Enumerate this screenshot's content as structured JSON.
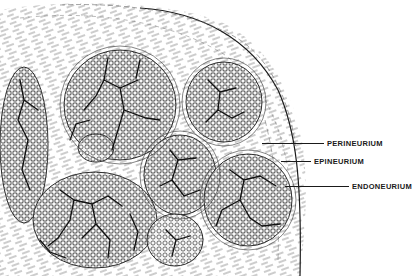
{
  "figure": {
    "style": "black ink line drawing on white",
    "colors": {
      "ink": "#1a1a1a",
      "background": "#ffffff",
      "fascicle_fill": "#f4f4f4"
    }
  },
  "labels": [
    {
      "id": "epineurium",
      "text": "EPINEURIUM",
      "x": 314,
      "y": 157,
      "line_from_x": 281,
      "line_to_x": 311
    },
    {
      "id": "perineurium",
      "text": "PERINEURIUM",
      "x": 327,
      "y": 140,
      "line_from_x": 262,
      "line_to_x": 324
    },
    {
      "id": "endoneurium",
      "text": "ENDONEURIUM",
      "x": 352,
      "y": 185,
      "line_from_x": 285,
      "line_to_x": 349
    }
  ],
  "fascicles": [
    {
      "cx": 120,
      "cy": 105,
      "rx": 56,
      "ry": 55
    },
    {
      "cx": 224,
      "cy": 102,
      "rx": 38,
      "ry": 40
    },
    {
      "cx": 24,
      "cy": 145,
      "rx": 24,
      "ry": 78
    },
    {
      "cx": 180,
      "cy": 175,
      "rx": 36,
      "ry": 40
    },
    {
      "cx": 248,
      "cy": 200,
      "rx": 44,
      "ry": 46
    },
    {
      "cx": 95,
      "cy": 220,
      "rx": 62,
      "ry": 48
    },
    {
      "cx": 175,
      "cy": 240,
      "rx": 28,
      "ry": 26
    },
    {
      "cx": 96,
      "cy": 148,
      "rx": 18,
      "ry": 14
    }
  ]
}
